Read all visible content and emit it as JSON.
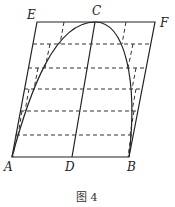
{
  "figure": {
    "caption": "图 4",
    "points": {
      "E": {
        "label": "E",
        "x": 37,
        "y": 22
      },
      "C": {
        "label": "C",
        "x": 95,
        "y": 22
      },
      "F": {
        "label": "F",
        "x": 155,
        "y": 22
      },
      "A": {
        "label": "A",
        "x": 12,
        "y": 157
      },
      "D": {
        "label": "D",
        "x": 72,
        "y": 157
      },
      "B": {
        "label": "B",
        "x": 129,
        "y": 157
      }
    },
    "dashed_levels_y": [
      44,
      68,
      89,
      111,
      135
    ]
  }
}
